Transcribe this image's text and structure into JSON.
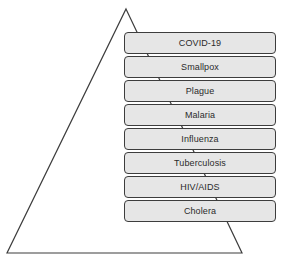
{
  "diagram": {
    "type": "layered-pyramid-list",
    "background_color": "#ffffff",
    "triangle": {
      "name": "pyramid-outline",
      "stroke_color": "#3d3d3d",
      "fill": "none",
      "stroke_width": 1.2,
      "apex": {
        "x": 126,
        "y": 9
      },
      "bottom_left": {
        "x": 7,
        "y": 253
      },
      "bottom_right": {
        "x": 242,
        "y": 253
      }
    },
    "boxes": {
      "fill_color": "#e6e6e6",
      "border_color": "#3d3d3d",
      "text_color": "#2b2b2b",
      "corner_radius": 4,
      "left": 124,
      "top": 32,
      "width": 152,
      "height": 22,
      "pitch": 24,
      "items": [
        {
          "label": "COVID-19"
        },
        {
          "label": "Smallpox"
        },
        {
          "label": "Plague"
        },
        {
          "label": "Malaria"
        },
        {
          "label": "Influenza"
        },
        {
          "label": "Tuberculosis"
        },
        {
          "label": "HIV/AIDS"
        },
        {
          "label": "Cholera"
        }
      ]
    }
  }
}
